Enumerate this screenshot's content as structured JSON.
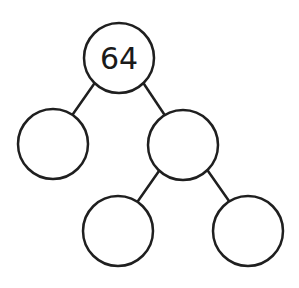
{
  "diagram": {
    "type": "number-bond-tree",
    "stroke_color": "#1f1f1f",
    "background": "#ffffff",
    "nodes": [
      {
        "id": "root",
        "label": "64",
        "cx": 119,
        "cy": 58,
        "r": 35
      },
      {
        "id": "left",
        "label": "",
        "cx": 53,
        "cy": 144,
        "r": 35
      },
      {
        "id": "right",
        "label": "",
        "cx": 183,
        "cy": 145,
        "r": 35
      },
      {
        "id": "right-left",
        "label": "",
        "cx": 118,
        "cy": 231,
        "r": 35
      },
      {
        "id": "right-right",
        "label": "",
        "cx": 248,
        "cy": 231,
        "r": 35
      }
    ],
    "edges": [
      {
        "from": "root",
        "to": "left"
      },
      {
        "from": "root",
        "to": "right"
      },
      {
        "from": "right",
        "to": "right-left"
      },
      {
        "from": "right",
        "to": "right-right"
      }
    ]
  }
}
